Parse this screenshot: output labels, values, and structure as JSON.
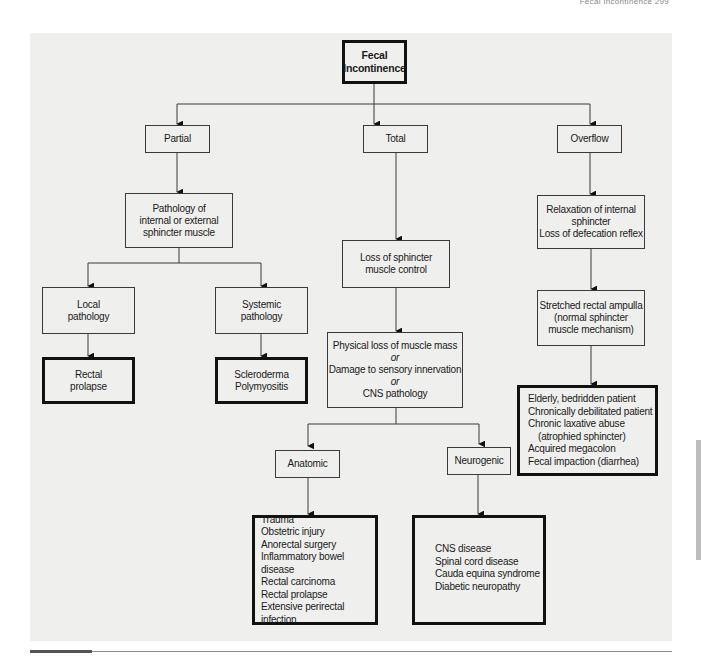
{
  "running_head": "Fecal Incontinence   299",
  "diagram": {
    "root": {
      "lines": [
        "Fecal",
        "Incontinence"
      ]
    },
    "branches": {
      "partial": {
        "label": "Partial",
        "cause": {
          "lines": [
            "Pathology of",
            "internal or external",
            "sphincter muscle"
          ]
        },
        "local": {
          "label": {
            "lines": [
              "Local",
              "pathology"
            ]
          },
          "result": {
            "lines": [
              "Rectal",
              "prolapse"
            ]
          }
        },
        "systemic": {
          "label": {
            "lines": [
              "Systemic",
              "pathology"
            ]
          },
          "result": {
            "lines": [
              "Scleroderma",
              "Polymyositis"
            ]
          }
        }
      },
      "total": {
        "label": "Total",
        "cause": {
          "lines": [
            "Loss of sphincter",
            "muscle control"
          ]
        },
        "mechanism": {
          "lines": [
            "Physical loss of muscle mass",
            "or",
            "Damage to sensory innervation",
            "or",
            "CNS pathology"
          ]
        },
        "anatomic": {
          "label": "Anatomic",
          "items": [
            "Trauma",
            "Obstetric injury",
            "Anorectal surgery",
            "Inflammatory bowel disease",
            "Rectal carcinoma",
            "Rectal prolapse",
            "Extensive perirectal infection"
          ]
        },
        "neurogenic": {
          "label": "Neurogenic",
          "items": [
            "CNS disease",
            "Spinal cord disease",
            "Cauda equina syndrome",
            "Diabetic neuropathy"
          ]
        }
      },
      "overflow": {
        "label": "Overflow",
        "cause": {
          "lines": [
            "Relaxation of internal",
            "sphincter",
            "Loss of defecation reflex"
          ]
        },
        "mechanism": {
          "lines": [
            "Stretched rectal ampulla",
            "(normal sphincter",
            "muscle mechanism)"
          ]
        },
        "items": [
          "Elderly, bedridden patient",
          "Chronically debilitated patient",
          "Chronic laxative abuse",
          "(atrophied sphincter)",
          "Acquired megacolon",
          "Fecal impaction (diarrhea)"
        ]
      }
    }
  },
  "colors": {
    "panel_bg": "#efefed",
    "line": "#3a3a3a",
    "thick_border": "#111111"
  }
}
